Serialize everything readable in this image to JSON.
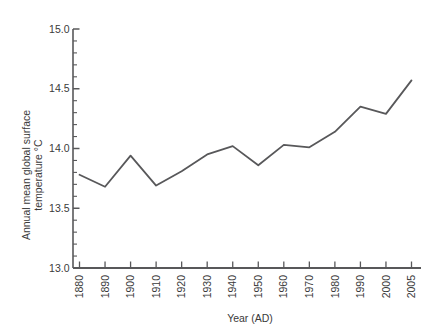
{
  "chart_data": {
    "type": "line",
    "title": "",
    "subtitle": "",
    "xlabel": "Year (AD)",
    "ylabel": "Annual mean global surface temperature °C",
    "ylabel_line1": "Annual mean global surface",
    "ylabel_line2": "temperature °C",
    "x": [
      1880,
      1890,
      1900,
      1910,
      1920,
      1930,
      1940,
      1950,
      1960,
      1970,
      1980,
      1990,
      2000,
      2005
    ],
    "values": [
      13.78,
      13.68,
      13.94,
      13.69,
      13.81,
      13.95,
      14.02,
      13.86,
      14.03,
      14.01,
      14.14,
      14.35,
      14.29,
      14.57
    ],
    "series": [
      {
        "name": "Annual mean global surface temperature",
        "values": [
          13.78,
          13.68,
          13.94,
          13.69,
          13.81,
          13.95,
          14.02,
          13.86,
          14.03,
          14.01,
          14.14,
          14.35,
          14.29,
          14.57
        ]
      }
    ],
    "xtick_labels": [
      "1880",
      "1890",
      "1900",
      "1910",
      "1920",
      "1930",
      "1940",
      "1950",
      "1960",
      "1970",
      "1980",
      "1990",
      "2000",
      "2005"
    ],
    "ytick_labels": [
      "13.0",
      "13.5",
      "14.0",
      "14.5",
      "15.0"
    ],
    "ytick_values": [
      13.0,
      13.5,
      14.0,
      14.5,
      15.0
    ],
    "yminor_step": 0.1,
    "ylim": [
      13.0,
      15.0
    ],
    "xlim_index": [
      0,
      13
    ],
    "grid": false,
    "legend": false,
    "legend_position": "none",
    "line_color": "#58585a",
    "axis_color": "#58585a",
    "background_color": "#ffffff",
    "xtick_rotation": -90
  },
  "figure": {
    "name": "global-surface-temperature-line-chart"
  }
}
